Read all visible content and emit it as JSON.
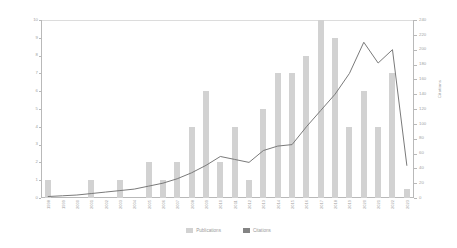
{
  "chart_data": {
    "type": "bar",
    "title": "",
    "subtitle": "",
    "xlabel": "",
    "ylabel": "Publications",
    "y2label": "Citations",
    "grid": false,
    "legend_position": "bottom",
    "categories": [
      "1998",
      "1999",
      "2000",
      "2001",
      "2002",
      "2003",
      "2004",
      "2005",
      "2006",
      "2007",
      "2008",
      "2009",
      "2010",
      "2011",
      "2012",
      "2013",
      "2014",
      "2015",
      "2016",
      "2017",
      "2018",
      "2019",
      "2020",
      "2021",
      "2022",
      "2023"
    ],
    "ylim": [
      0,
      10
    ],
    "yticks": [
      "0",
      "1",
      "2",
      "3",
      "4",
      "5",
      "6",
      "7",
      "8",
      "9",
      "10"
    ],
    "y2lim": [
      0,
      240
    ],
    "y2ticks": [
      "0",
      "20",
      "40",
      "60",
      "80",
      "100",
      "120",
      "140",
      "160",
      "180",
      "200",
      "220",
      "240"
    ],
    "series": [
      {
        "name": "Publications",
        "type": "bar",
        "axis": "left",
        "color": "#d2d2d2",
        "values": [
          1,
          0,
          0,
          1,
          0,
          1,
          0,
          2,
          1,
          2,
          4,
          6,
          2,
          4,
          1,
          5,
          7,
          7,
          8,
          10,
          9,
          4,
          6,
          4,
          7,
          0.5
        ]
      },
      {
        "name": "Citations",
        "type": "line",
        "axis": "right",
        "color": "#7a7a7a",
        "values": [
          2,
          3,
          4,
          6,
          8,
          10,
          12,
          16,
          20,
          26,
          34,
          44,
          56,
          52,
          48,
          64,
          70,
          72,
          96,
          118,
          140,
          168,
          210,
          182,
          200,
          44
        ]
      }
    ],
    "legend": [
      {
        "label": "Publications",
        "color": "#d2d2d2"
      },
      {
        "label": "Citations",
        "color": "#848484"
      }
    ]
  }
}
